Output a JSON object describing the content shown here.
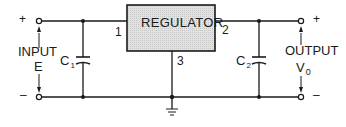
{
  "diagram": {
    "type": "circuit-schematic",
    "title": "",
    "regulator": {
      "label": "REGULATOR",
      "pins": {
        "in": "1",
        "out": "2",
        "gnd": "3"
      }
    },
    "input": {
      "label": "INPUT",
      "symbol": "E",
      "plus": "+",
      "minus": "–"
    },
    "output": {
      "label": "OUTPUT",
      "symbol": "V",
      "symbol_sub": "0",
      "plus": "+",
      "minus": "–"
    },
    "capacitors": [
      {
        "name": "C",
        "sub": "1"
      },
      {
        "name": "C",
        "sub": "2"
      }
    ],
    "colors": {
      "line": "#1a1a1a",
      "regulator_fill": "#dcdcdc"
    }
  }
}
